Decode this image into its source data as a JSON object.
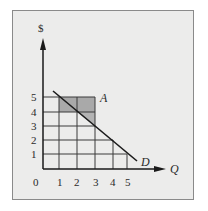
{
  "diagram": {
    "y_axis_label": "$",
    "x_axis_label": "Q",
    "origin_label": "0",
    "x_ticks": [
      "1",
      "2",
      "3",
      "4",
      "5"
    ],
    "y_ticks": [
      "5",
      "4",
      "3",
      "2",
      "1"
    ],
    "point_label": "A",
    "curve_label": "D",
    "colors": {
      "background": "#ececeb",
      "grid": "#3a3a3a",
      "shade_upper": "#a9a9a9",
      "shade_lower": "#b8b8b8",
      "line": "#1a1a1a"
    }
  }
}
